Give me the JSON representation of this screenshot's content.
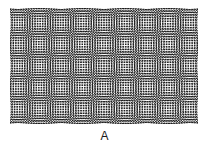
{
  "figure": {
    "label": "A",
    "caption_label": "A",
    "background_color": "#ffffff",
    "panel": {
      "x": 10,
      "y": 8,
      "width": 188,
      "height": 116,
      "background_color": "#fdfdfd",
      "dot_color": "#1f1f1f"
    }
  },
  "chart_data": {
    "type": "heatmap",
    "title": "A",
    "xlabel": "",
    "ylabel": "",
    "pattern": "moire-dot-lattice",
    "lattices": [
      {
        "name": "lattice-1",
        "pitch_px": 2.55,
        "rotation_deg": -3.4,
        "dot_radius_px": 0.72,
        "color": "#1f1f1f"
      },
      {
        "name": "lattice-2",
        "pitch_px": 2.55,
        "rotation_deg": 3.4,
        "dot_radius_px": 0.72,
        "color": "#1f1f1f"
      }
    ],
    "moire_cell_pitch_px": 38,
    "moire_cells_across": 5,
    "moire_cells_down": 3,
    "grid": false,
    "legend": "none",
    "xlim": [
      0,
      188
    ],
    "ylim": [
      0,
      116
    ]
  }
}
